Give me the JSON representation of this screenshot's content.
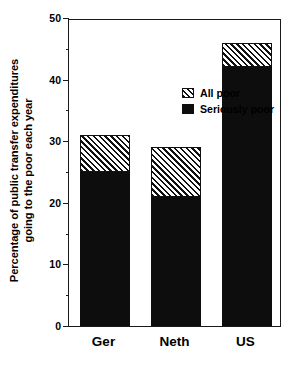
{
  "chart_data": {
    "type": "bar",
    "stacked": true,
    "title": "",
    "subtitle": "",
    "xlabel": "",
    "ylabel": "Percentage of public transfer expenditures going to the poor each year",
    "ylabel_lines": [
      "Percentage of public transfer expenditures",
      "going to the poor each year"
    ],
    "categories": [
      "Ger",
      "Neth",
      "US"
    ],
    "series": [
      {
        "name": "Seriously poor",
        "values": [
          25,
          21,
          42
        ],
        "fill": "solid-black"
      },
      {
        "name": "All poor",
        "values": [
          31,
          29,
          46
        ],
        "fill": "diagonal-hatch"
      }
    ],
    "segment_values": {
      "Ger": {
        "seriously_poor": 25,
        "all_poor_total": 31,
        "hatch_band": 6
      },
      "Neth": {
        "seriously_poor": 21,
        "all_poor_total": 29,
        "hatch_band": 8
      },
      "US": {
        "seriously_poor": 42,
        "all_poor_total": 46,
        "hatch_band": 4
      }
    },
    "ylim": [
      0,
      50
    ],
    "ytick_labels": [
      "0",
      "10",
      "20",
      "30",
      "40",
      "50"
    ],
    "ytick_values": [
      0,
      10,
      20,
      30,
      40,
      50
    ],
    "yminor_values": [
      5,
      15,
      25,
      35,
      45
    ],
    "grid": false,
    "legend": {
      "position": "inside-upper-left",
      "entries": [
        {
          "label": "All poor",
          "fill": "diagonal-hatch"
        },
        {
          "label": "Seriously poor",
          "fill": "solid-black"
        }
      ]
    },
    "colors": {
      "axis": "#1a1a1a",
      "solid": "#0d0d0d",
      "hatch_line": "#111111",
      "background": "#ffffff"
    }
  }
}
